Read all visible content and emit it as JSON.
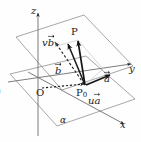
{
  "figure": {
    "kind": "3d-vector-plane-diagram",
    "caption_marker": ")",
    "axes": [
      {
        "name": "z-axis",
        "label": "z",
        "direction": "up"
      },
      {
        "name": "y-axis",
        "label": "y",
        "direction": "right"
      },
      {
        "name": "x-axis",
        "label": "x",
        "direction": "lower-right"
      }
    ],
    "points": [
      {
        "name": "origin",
        "label": "O"
      },
      {
        "name": "base-point",
        "label": "P",
        "subscript": "0"
      },
      {
        "name": "target-point",
        "label": "P",
        "subscript": ""
      }
    ],
    "vectors": [
      {
        "name": "vector-a",
        "label": "a",
        "style": "solid",
        "arrow": true
      },
      {
        "name": "vector-b",
        "label": "b",
        "style": "solid",
        "arrow": true
      },
      {
        "name": "vector-ua",
        "scalar": "u",
        "label": "a",
        "style": "solid",
        "arrow": true
      },
      {
        "name": "vector-vb",
        "scalar": "v",
        "label": "b",
        "style": "dashed",
        "arrow": true
      },
      {
        "name": "vector-p0p",
        "label": "",
        "style": "solid",
        "arrow": true
      }
    ],
    "planes": [
      {
        "name": "plane-alpha",
        "label": "α",
        "count": 2
      }
    ],
    "colors": {
      "stroke": "#4a4a4a",
      "stroke_strong": "#151515",
      "guide": "#c8c8c8",
      "background": "#fefefe",
      "text": "#1b1b1b"
    }
  },
  "labels": {
    "z": "z",
    "y": "y",
    "x": "x",
    "O": "O",
    "P": "P",
    "P0_letter": "P",
    "P0_sub": "0",
    "a": "a",
    "b": "b",
    "u": "u",
    "v": "v",
    "alpha_lower": "α",
    "alpha_upper": "α",
    "paren": ")"
  }
}
